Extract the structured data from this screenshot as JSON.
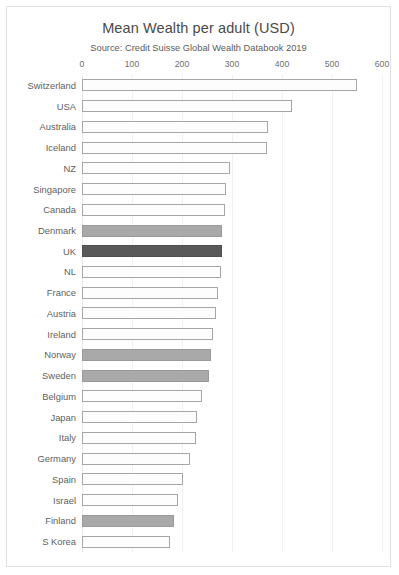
{
  "chart_data": {
    "type": "bar",
    "orientation": "horizontal",
    "title": "Mean Wealth per adult (USD)",
    "subtitle": "Source: Credit Suisse Global Wealth Databook 2019",
    "xlabel": "",
    "ylabel": "",
    "xlim": [
      0,
      600
    ],
    "xticks": [
      0,
      100,
      200,
      300,
      400,
      500,
      600
    ],
    "xtick_labels": [
      "0",
      "100",
      "200",
      "300",
      "400",
      "500",
      "600"
    ],
    "grid": "vertical",
    "legend": "none",
    "categories": [
      "Switzerland",
      "USA",
      "Australia",
      "Iceland",
      "NZ",
      "Singapore",
      "Canada",
      "Denmark",
      "UK",
      "NL",
      "France",
      "Austria",
      "Ireland",
      "Norway",
      "Sweden",
      "Belgium",
      "Japan",
      "Italy",
      "Germany",
      "Spain",
      "Israel",
      "Finland",
      "S Korea"
    ],
    "values": [
      549,
      420,
      371,
      370,
      296,
      288,
      286,
      280,
      280,
      278,
      272,
      267,
      261,
      257,
      253,
      239,
      229,
      227,
      216,
      202,
      192,
      184,
      176
    ],
    "bar_styles": [
      "outline",
      "outline",
      "outline",
      "outline",
      "outline",
      "outline",
      "outline",
      "filled-light",
      "filled-dark",
      "outline",
      "outline",
      "outline",
      "outline",
      "filled-light",
      "filled-light",
      "outline",
      "outline",
      "outline",
      "outline",
      "outline",
      "outline",
      "filled-light",
      "outline"
    ],
    "colors": {
      "bar_outline": "#a6a6a6",
      "bar_fill_default": "#fdfdfd",
      "bar_fill_light": "#a9a9a9",
      "bar_fill_dark": "#595959",
      "gridline": "#f1f1f1",
      "frame_border": "#e2e2e2",
      "text": "#5f5f5f",
      "background": "#ffffff"
    }
  }
}
